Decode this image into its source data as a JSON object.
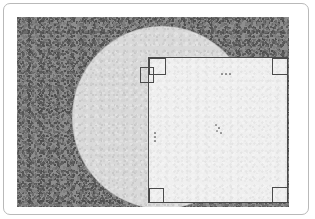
{
  "image": {
    "title": "Microscope sample overview",
    "frame_label": "image-border",
    "background_label": "speckled-background-field"
  },
  "colors": {
    "page_background": "#ffffff",
    "frame_border": "#b9b9b9",
    "field_background": "#8e8e8e",
    "circle_fill": "#d9d9d9",
    "square_fill": "#efefef",
    "line_stroke": "#4a4a4a",
    "dot_color": "#8d8d8d"
  },
  "regions": {
    "field": {
      "label": "noise-field",
      "left": 13,
      "top": 13,
      "width": 272,
      "height": 190
    },
    "circle": {
      "label": "circular-substrate",
      "left": 68,
      "top": 22,
      "diameter_x": 180,
      "diameter_y": 183
    },
    "square": {
      "label": "inscribed-sample-square",
      "left": 89,
      "top": 44,
      "width": 140,
      "height": 146
    }
  },
  "markers": {
    "corner_top_left_outer": "fiducial-square",
    "corner_top_left_inner": "fiducial-square",
    "corner_top_right": "fiducial-square",
    "corner_bottom_left": "fiducial-square",
    "corner_bottom_right": "fiducial-square"
  },
  "features": {
    "top_dots": {
      "label": "dot-cluster-top",
      "count": 3,
      "arrangement": "horizontal"
    },
    "left_dots": {
      "label": "dot-cluster-left",
      "count": 3,
      "arrangement": "vertical"
    },
    "center_dots": {
      "label": "dot-cluster-center",
      "count": 4,
      "arrangement": "diagonal"
    }
  }
}
